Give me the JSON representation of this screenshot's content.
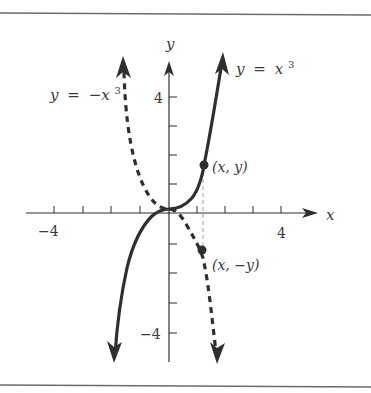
{
  "figure": {
    "axes": {
      "x_label": "x",
      "y_label": "y",
      "x_tick_labels": {
        "neg": "−4",
        "pos": "4"
      },
      "y_tick_labels": {
        "pos": "4",
        "neg": "−4"
      }
    },
    "curves": {
      "solid": {
        "label_lhs": "y",
        "label_eq": "=",
        "label_base": "x",
        "label_exp": "3",
        "style": "solid"
      },
      "dashed": {
        "label_lhs": "y",
        "label_eq": "=",
        "label_base": "−x",
        "label_exp": "3",
        "style": "dashed"
      }
    },
    "points": {
      "upper": {
        "label": "(x, y)"
      },
      "lower": {
        "label": "(x, −y)"
      }
    },
    "colors": {
      "ink": "#2f2f2f",
      "rule": "#6b6b6b",
      "guide": "#8a8a8a",
      "background": "#ffffff"
    }
  }
}
